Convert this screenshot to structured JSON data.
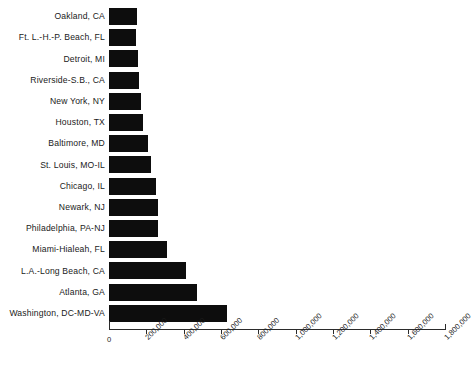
{
  "chart_data": {
    "type": "bar",
    "orientation": "horizontal",
    "title": "",
    "xlabel": "",
    "ylabel": "",
    "xlim": [
      0,
      1800000
    ],
    "grid": false,
    "legend": null,
    "bar_color": "#0d0d0d",
    "axis_color": "#2b2b2b",
    "xticks": [
      0,
      200000,
      400000,
      600000,
      800000,
      1000000,
      1200000,
      1400000,
      1600000,
      1800000
    ],
    "xtick_labels": [
      "0",
      "200,000",
      "400,000",
      "600,000",
      "800,000",
      "1,000,000",
      "1,200,000",
      "1,400,000",
      "1,600,000",
      "1,800,000"
    ],
    "xtick_label_rotation": -45,
    "categories": [
      "Oakland, CA",
      "Ft. L.-H.-P. Beach, FL",
      "Detroit, MI",
      "Riverside-S.B., CA",
      "New York, NY",
      "Houston, TX",
      "Baltimore, MD",
      "St. Louis, MO-IL",
      "Chicago, IL",
      "Newark, NJ",
      "Philadelphia, PA-NJ",
      "Miami-Hialeah, FL",
      "L.A.-Long Beach, CA",
      "Atlanta, GA",
      "Washington, DC-MD-VA"
    ],
    "values": [
      150000,
      145000,
      155000,
      160000,
      170000,
      180000,
      210000,
      225000,
      250000,
      265000,
      265000,
      310000,
      415000,
      470000,
      630000
    ]
  },
  "caption": {
    "text": ""
  }
}
